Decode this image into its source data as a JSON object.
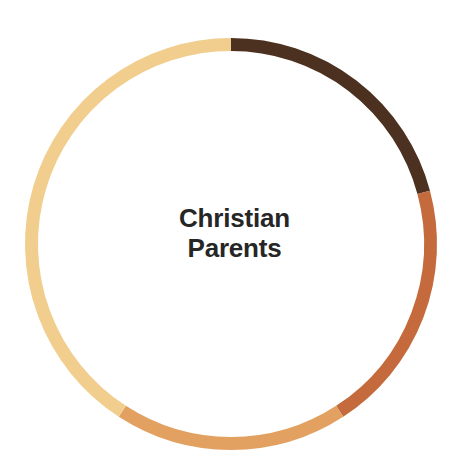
{
  "chart_data": {
    "type": "pie",
    "variant": "donut",
    "title": "Christian Parents",
    "center_label_lines": [
      "Christian",
      "Parents"
    ],
    "xlabel": "",
    "ylabel": "",
    "legend": "none",
    "grid": false,
    "background_color": "#FFFFFF",
    "label_color": "#262626",
    "geometry": {
      "center_x": 231,
      "center_y": 244,
      "outer_radius": 206,
      "inner_radius": 193,
      "ring_thickness": 13,
      "start_angle_deg": 0,
      "direction": "clockwise"
    },
    "categories": [
      "Segment 1",
      "Segment 2",
      "Segment 3",
      "Segment 4"
    ],
    "values": [
      20.8,
      20.0,
      18.3,
      40.9
    ],
    "angles_deg": [
      75,
      72,
      66,
      147
    ],
    "colors": [
      "#4C3020",
      "#C56A3C",
      "#E2A061",
      "#F1CE8D"
    ],
    "segments": [
      {
        "name": "Segment 1",
        "color": "#4C3020",
        "start_angle_deg": 0,
        "end_angle_deg": 75,
        "sweep_deg": 75,
        "value": 20.8
      },
      {
        "name": "Segment 2",
        "color": "#C56A3C",
        "start_angle_deg": 75,
        "end_angle_deg": 147,
        "sweep_deg": 72,
        "value": 20.0
      },
      {
        "name": "Segment 3",
        "color": "#E2A061",
        "start_angle_deg": 147,
        "end_angle_deg": 213,
        "sweep_deg": 66,
        "value": 18.3
      },
      {
        "name": "Segment 4",
        "color": "#F1CE8D",
        "start_angle_deg": 213,
        "end_angle_deg": 360,
        "sweep_deg": 147,
        "value": 40.9
      }
    ]
  }
}
